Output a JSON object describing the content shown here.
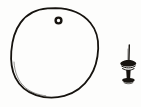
{
  "image": {
    "kind": "line-drawing",
    "medium": "black ink pen sketch",
    "background_color": "#fdfdfc",
    "ink_color": "#16130f",
    "width": 141,
    "height": 107,
    "caption": "Hand-drawn sketch of a round fruit beside a small screw",
    "object_count": 2
  },
  "objects": [
    {
      "id": "round-fruit",
      "label": "round fruit",
      "description": "Large irregular hand-drawn circle outline, slightly lumpy, open contour suggesting an orange or ball",
      "center_x": 54,
      "center_y": 53,
      "radius_x": 43,
      "radius_y": 45,
      "stroke_width": 1.7,
      "bounds": {
        "x": 11,
        "y": 8,
        "width": 87,
        "height": 90
      },
      "parts": [
        {
          "id": "stem-scar",
          "label": "stem scar",
          "description": "Small dark ring marking the stem end near the top of the fruit",
          "center_x": 58.5,
          "center_y": 20.5,
          "outer_radius": 4.1,
          "inner_radius": 1.7,
          "stroke_width": 2.4
        }
      ]
    },
    {
      "id": "screw",
      "label": "screw",
      "description": "Small upright screw with a thin pointed shaft, a ridged knurled knob, a narrow neck and a flared base",
      "center_x": 128,
      "center_y": 67,
      "bounds": {
        "x": 119,
        "y": 44,
        "width": 18,
        "height": 42
      },
      "parts": [
        {
          "id": "screw-shaft",
          "label": "shaft",
          "description": "Thin vertical pointed shaft rising from the knob",
          "x": 129,
          "y_top": 45,
          "y_bottom": 61,
          "stroke_width": 1.3
        },
        {
          "id": "screw-knob",
          "label": "knurled knob",
          "description": "Wide ridged knob with horizontal banding",
          "center_x": 128,
          "center_y": 65,
          "width": 15,
          "height": 9
        },
        {
          "id": "screw-neck",
          "label": "neck",
          "description": "Narrow waist below the knob",
          "center_x": 128,
          "center_y": 74,
          "width": 5,
          "height": 8
        },
        {
          "id": "screw-base",
          "label": "base flange",
          "description": "Flared flat base at the bottom",
          "center_x": 128,
          "center_y": 81,
          "width": 11,
          "height": 5
        }
      ]
    }
  ]
}
